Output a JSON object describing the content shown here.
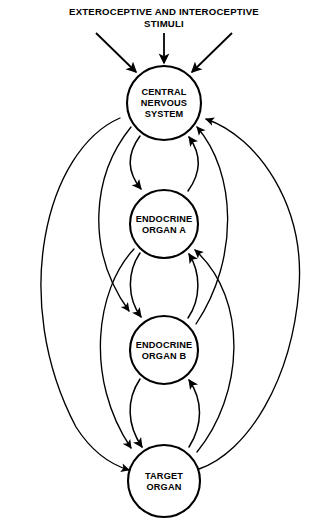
{
  "diagram": {
    "title_line_1": "EXTEROCEPTIVE AND INTEROCEPTIVE",
    "title_line_2": "STIMULI",
    "colors": {
      "background": "#ffffff",
      "stroke": "#000000",
      "node_fill": "#ffffff"
    },
    "nodes": [
      {
        "id": "central-nervous-system",
        "label_lines": [
          "CENTRAL",
          "NERVOUS",
          "SYSTEM"
        ],
        "cx": 164,
        "cy": 103,
        "r": 37
      },
      {
        "id": "endocrine-organ-a",
        "label_lines": [
          "ENDOCRINE",
          "ORGAN A"
        ],
        "cx": 164,
        "cy": 224,
        "r": 34
      },
      {
        "id": "endocrine-organ-b",
        "label_lines": [
          "ENDOCRINE",
          "ORGAN B"
        ],
        "cx": 164,
        "cy": 350,
        "r": 34
      },
      {
        "id": "target-organ",
        "label_lines": [
          "TARGET",
          "ORGAN"
        ],
        "cx": 164,
        "cy": 481,
        "r": 36
      }
    ],
    "stimuli_arrows": [
      {
        "id": "stimulus-left",
        "label": "exteroceptive and interoceptive stimulus left"
      },
      {
        "id": "stimulus-center",
        "label": "exteroceptive and interoceptive stimulus center"
      },
      {
        "id": "stimulus-right",
        "label": "exteroceptive and interoceptive stimulus right"
      }
    ],
    "connections": [
      {
        "id": "cns-to-organ-a",
        "from": "central-nervous-system",
        "to": "endocrine-organ-a",
        "direction": "down",
        "route": "inner-left"
      },
      {
        "id": "organ-a-to-cns",
        "from": "endocrine-organ-a",
        "to": "central-nervous-system",
        "direction": "up",
        "route": "inner-right"
      },
      {
        "id": "organ-a-to-organ-b",
        "from": "endocrine-organ-a",
        "to": "endocrine-organ-b",
        "direction": "down",
        "route": "inner-left"
      },
      {
        "id": "organ-b-to-organ-a",
        "from": "endocrine-organ-b",
        "to": "endocrine-organ-a",
        "direction": "up",
        "route": "inner-right"
      },
      {
        "id": "organ-b-to-target-organ",
        "from": "endocrine-organ-b",
        "to": "target-organ",
        "direction": "down",
        "route": "inner-left"
      },
      {
        "id": "target-organ-to-organ-b",
        "from": "target-organ",
        "to": "endocrine-organ-b",
        "direction": "up",
        "route": "inner-right"
      },
      {
        "id": "cns-to-organ-b",
        "from": "central-nervous-system",
        "to": "endocrine-organ-b",
        "direction": "down",
        "route": "outer-left"
      },
      {
        "id": "cns-to-target-organ",
        "from": "central-nervous-system",
        "to": "target-organ",
        "direction": "down",
        "route": "far-outer-left"
      },
      {
        "id": "organ-a-to-target-organ",
        "from": "endocrine-organ-a",
        "to": "target-organ",
        "direction": "down",
        "route": "mid-outer-left"
      },
      {
        "id": "organ-b-to-cns",
        "from": "endocrine-organ-b",
        "to": "central-nervous-system",
        "direction": "up",
        "route": "outer-right"
      },
      {
        "id": "target-organ-to-cns",
        "from": "target-organ",
        "to": "central-nervous-system",
        "direction": "up",
        "route": "far-outer-right"
      },
      {
        "id": "target-organ-to-organ-a",
        "from": "target-organ",
        "to": "endocrine-organ-a",
        "direction": "up",
        "route": "mid-outer-right"
      }
    ]
  }
}
